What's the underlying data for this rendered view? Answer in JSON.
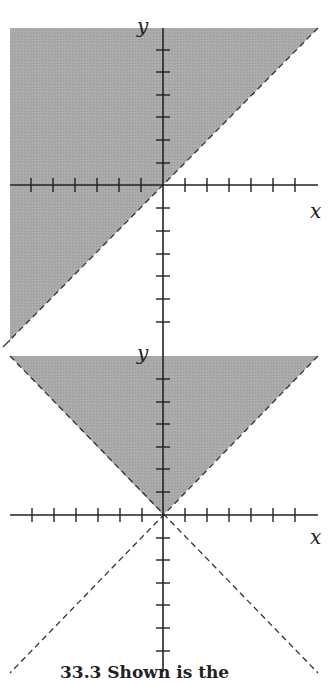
{
  "figures": [
    {
      "id": "top",
      "description": "Half-plane y > x shaded, boundary y = x dashed",
      "x_label": "x",
      "y_label": "y",
      "shade_color": "#a9a9a9",
      "boundary": "y = x (dashed)",
      "ticks_per_half_axis": 6
    },
    {
      "id": "bottom",
      "description": "Region y > |x| shaded, boundaries y = x and y = -x dashed",
      "x_label": "x",
      "y_label": "y",
      "shade_color": "#a9a9a9",
      "boundary": "y = |x| (dashed), lines y = ±x extended dashed below",
      "ticks_per_half_axis": 6
    }
  ],
  "caption": "33.3  Shown is the"
}
